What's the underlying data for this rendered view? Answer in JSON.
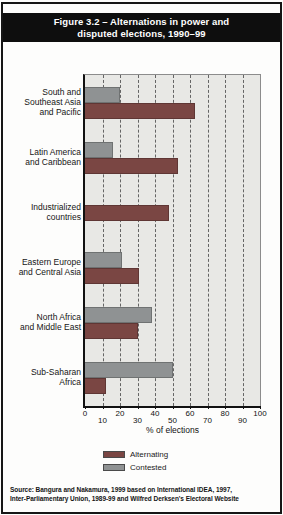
{
  "figure": {
    "title_line1": "Figure 3.2 – Alternations in power and",
    "title_line2": "disputed elections, 1990–99",
    "source_line1": "Source: Bangura and Nakamura, 1999 based on International IDEA, 1997,",
    "source_line2": "Inter-Parliamentary Union, 1989-99 and Wilfred Derksen's Electoral Website"
  },
  "colors": {
    "title_bg": "#0e0e0e",
    "title_text": "#ffffff",
    "plot_bg": "#e8e8e5",
    "gridline": "#4f4f4f",
    "axis": "#111111",
    "alternating": "#7a4643",
    "contested": "#8f9293"
  },
  "chart_data": {
    "type": "bar",
    "orientation": "horizontal",
    "title": "Figure 3.2 – Alternations in power and disputed elections, 1990–99",
    "xlabel": "% of elections",
    "xlim": [
      0,
      100
    ],
    "xticks": [
      0,
      10,
      20,
      30,
      40,
      50,
      60,
      70,
      80,
      90,
      100
    ],
    "grid": "vertical-dashed",
    "legend_position": "below",
    "categories": [
      "South and\nSoutheast Asia\nand Pacific",
      "Latin America\nand Caribbean",
      "Industrialized\ncountries",
      "Eastern Europe\nand Central Asia",
      "North Africa\nand Middle East",
      "Sub-Saharan\nAfrica"
    ],
    "series": [
      {
        "name": "Contested",
        "color_key": "contested",
        "position": "top",
        "values": [
          20,
          16,
          0,
          21,
          38,
          50
        ]
      },
      {
        "name": "Alternating",
        "color_key": "alternating",
        "position": "bottom",
        "values": [
          63,
          53,
          48,
          31,
          30,
          12
        ]
      }
    ],
    "legend": [
      {
        "label": "Alternating",
        "color_key": "alternating"
      },
      {
        "label": "Contested",
        "color_key": "contested"
      }
    ]
  }
}
